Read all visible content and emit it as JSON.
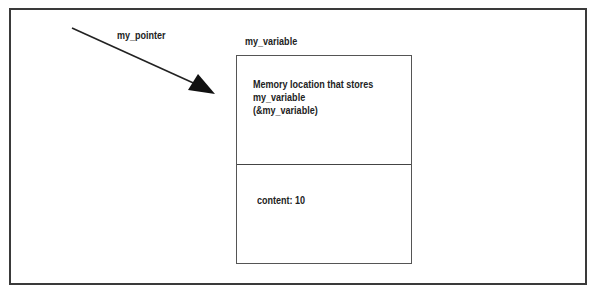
{
  "diagram": {
    "pointer_label": "my_pointer",
    "variable_label": "my_variable",
    "address_cell": {
      "lines": [
        "Memory location that stores",
        "my_variable",
        "(&my_variable)"
      ]
    },
    "content_cell": {
      "text": "content: 10"
    },
    "colors": {
      "stroke": "#333333",
      "text": "#222222",
      "background": "#ffffff"
    }
  }
}
